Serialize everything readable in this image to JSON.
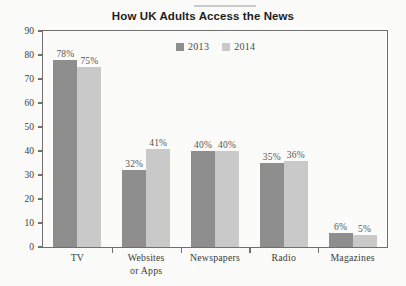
{
  "chart_data": {
    "type": "bar",
    "title": "How UK Adults Access the News",
    "xlabel": "",
    "ylabel": "% of UK adults",
    "ylim": [
      0,
      90
    ],
    "ytick_step": 10,
    "yticks": [
      90,
      80,
      70,
      60,
      50,
      40,
      30,
      20,
      10,
      0
    ],
    "grid": false,
    "legend_position": "top-center-inside",
    "categories": [
      "TV",
      "Websites\nor Apps",
      "Newspapers",
      "Radio",
      "Magazines"
    ],
    "category_lines": [
      [
        "TV"
      ],
      [
        "Websites",
        "or Apps"
      ],
      [
        "Newspapers"
      ],
      [
        "Radio"
      ],
      [
        "Magazines"
      ]
    ],
    "series": [
      {
        "name": "2013",
        "color": "#8e8e8e",
        "values": [
          78,
          32,
          40,
          35,
          6
        ],
        "labels": [
          "78%",
          "32%",
          "40%",
          "35%",
          "6%"
        ]
      },
      {
        "name": "2014",
        "color": "#c9c9c9",
        "values": [
          75,
          41,
          40,
          36,
          5
        ],
        "labels": [
          "75%",
          "41%",
          "40%",
          "36%",
          "5%"
        ]
      }
    ]
  },
  "legend": {
    "entries": [
      {
        "label": "2013",
        "color": "#8e8e8e"
      },
      {
        "label": "2014",
        "color": "#c9c9c9"
      }
    ]
  },
  "colors": {
    "background": "#fbfbf9",
    "frame": "#6f6f6f",
    "series_2013": "#8e8e8e",
    "series_2014": "#c9c9c9",
    "text": "#3a3a3a",
    "title_text": "#1d1d1d"
  }
}
